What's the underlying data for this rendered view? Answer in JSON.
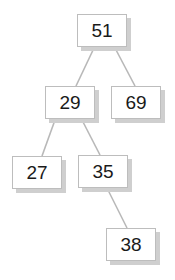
{
  "diagram": {
    "type": "binary-search-tree",
    "colors": {
      "edge": "#b8b8b8",
      "box_border": "#bdbdbd",
      "shadow": "#cfcfcf",
      "text": "#1a1a1a"
    },
    "nodes": [
      {
        "id": "n51",
        "value": "51",
        "x": 77,
        "y": 14
      },
      {
        "id": "n29",
        "value": "29",
        "x": 45,
        "y": 86
      },
      {
        "id": "n69",
        "value": "69",
        "x": 111,
        "y": 86
      },
      {
        "id": "n27",
        "value": "27",
        "x": 12,
        "y": 156
      },
      {
        "id": "n35",
        "value": "35",
        "x": 78,
        "y": 155
      },
      {
        "id": "n38",
        "value": "38",
        "x": 106,
        "y": 228
      }
    ],
    "edges": [
      {
        "from": "51",
        "to": "29"
      },
      {
        "from": "51",
        "to": "69"
      },
      {
        "from": "29",
        "to": "27"
      },
      {
        "from": "29",
        "to": "35"
      },
      {
        "from": "35",
        "to": "38"
      }
    ]
  }
}
